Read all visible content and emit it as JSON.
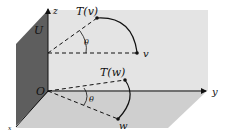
{
  "diagram": {
    "labels": {
      "z_axis": "z",
      "y_axis": "y",
      "x_axis": "x",
      "plane_U": "U",
      "origin": "O",
      "vector_v": "v",
      "vector_Tv": "T(v)",
      "vector_w": "w",
      "vector_Tw": "T(w)",
      "angle_top": "θ",
      "angle_bottom": "θ"
    },
    "colors": {
      "back_plane": "#e4e4e4",
      "floor_plane": "#cfcfcf",
      "side_plane": "#5e5e5e",
      "ink": "#111111"
    }
  }
}
